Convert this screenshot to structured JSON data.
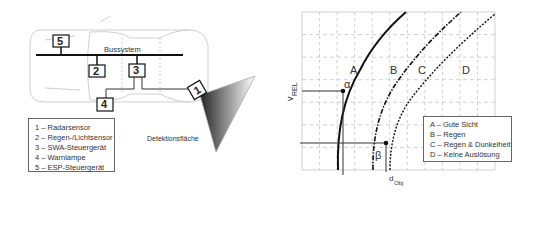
{
  "left_diagram": {
    "bus_label": "Bussystem",
    "detection_label": "Detektionsfläche",
    "components": [
      {
        "num": "1",
        "name": "Radarsensor"
      },
      {
        "num": "2",
        "name": "Regen-/Lichtsensor"
      },
      {
        "num": "3",
        "name": "SWA-Steuergerät"
      },
      {
        "num": "4",
        "name": "Warnlampe"
      },
      {
        "num": "5",
        "name": "ESP-Steuergerät"
      }
    ],
    "legend": [
      "1 – Radarsensor",
      "2 – Regen-/Lichtsensor",
      "3 – SWA-Steuergerät",
      "4 – Warnlampe",
      "5 – ESP-Steuergerät"
    ]
  },
  "right_chart": {
    "y_axis_label": "v",
    "y_axis_sub": "REL",
    "x_axis_label": "d",
    "x_axis_sub": "Obj",
    "point_labels": {
      "alpha": "α",
      "beta": "β"
    },
    "curve_labels": [
      "A",
      "B",
      "C",
      "D"
    ],
    "legend": [
      "A – Gute Sicht",
      "B – Regen",
      "C – Regen & Dunkelheit",
      "D – Keine Auslösung"
    ],
    "colors": {
      "curve": "#111111",
      "grid": "#bbbbbb",
      "frame": "#666666"
    }
  }
}
